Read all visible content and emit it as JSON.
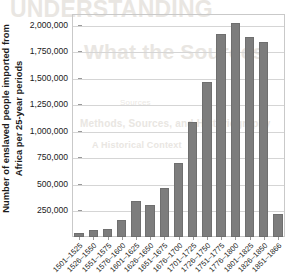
{
  "chart_data": {
    "type": "bar",
    "title": "",
    "xlabel": "",
    "ylabel": "Number of enslaved people imported from Africa per 25-year periods",
    "ylabel_line1": "Number of enslaved people imported from",
    "ylabel_line2": "Africa per 25-year periods",
    "ylim": [
      0,
      2100000
    ],
    "ytick_labels": [
      "2,000,000",
      "1,750,000",
      "1,500,000",
      "1,250,000",
      "1,000,000",
      "750,000",
      "500,000",
      "250,000"
    ],
    "ytick_values": [
      2000000,
      1750000,
      1500000,
      1250000,
      1000000,
      750000,
      500000,
      250000
    ],
    "grid": true,
    "legend": "none",
    "bar_color": "#7d7d7d",
    "categories": [
      "1501–1525",
      "1526–1550",
      "1551–1575",
      "1576–1600",
      "1601–1625",
      "1626–1650",
      "1651–1675",
      "1676–1700",
      "1701–1725",
      "1726–1750",
      "1751–1775",
      "1776–1800",
      "1801–1825",
      "1826–1850",
      "1851–1866"
    ],
    "values": [
      40000,
      70000,
      80000,
      160000,
      340000,
      300000,
      460000,
      700000,
      1080000,
      1460000,
      1910000,
      2020000,
      1880000,
      1840000,
      215000
    ]
  },
  "watermark": {
    "top": "UNDERSTANDING",
    "title": "What the Sources",
    "sub1": "Sources",
    "sub2": "Methods, Sources, and Historiography",
    "sub3": "A Historical Context"
  }
}
